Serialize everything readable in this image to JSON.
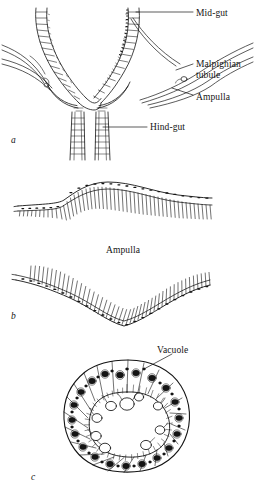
{
  "figure": {
    "background_color": "#ffffff",
    "ink_color": "#141414",
    "panels": [
      {
        "letter": "a",
        "name": "gut-junction-panel",
        "description": "Longitudinal section of the mid-gut / hind-gut junction showing Malpighian tubules entering via ampullae",
        "labels": [
          {
            "id": "mid-gut",
            "text": "Mid-gut"
          },
          {
            "id": "malpighian-tubule",
            "text": "Malpighian\ntubule"
          },
          {
            "id": "ampulla",
            "text": "Ampulla"
          },
          {
            "id": "hind-gut",
            "text": "Hind-gut"
          }
        ]
      },
      {
        "letter": "b",
        "name": "ampulla-longitudinal-panel",
        "description": "Two longitudinal views of ampulla epithelium with brush border",
        "labels": [
          {
            "id": "ampulla",
            "text": "Ampulla"
          }
        ]
      },
      {
        "letter": "c",
        "name": "ampulla-cross-section-panel",
        "description": "Transverse section of the ampulla showing epithelial cells, nuclei, brush border and vacuoles",
        "labels": [
          {
            "id": "vacuole",
            "text": "Vacuole"
          }
        ]
      }
    ]
  },
  "labels": {
    "mid_gut": "Mid-gut",
    "malpighian_line1": "Malpighian",
    "malpighian_line2": "tubule",
    "ampulla_a": "Ampulla",
    "hind_gut": "Hind-gut",
    "ampulla_b": "Ampulla",
    "vacuole": "Vacuole",
    "panel_a": "a",
    "panel_b": "b",
    "panel_c": "c"
  }
}
